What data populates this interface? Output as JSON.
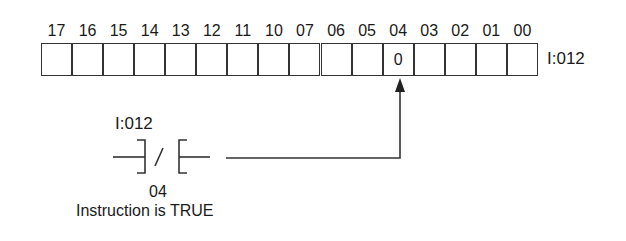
{
  "register": {
    "label": "I:012",
    "bits": [
      "17",
      "16",
      "15",
      "14",
      "13",
      "12",
      "11",
      "10",
      "07",
      "06",
      "05",
      "04",
      "03",
      "02",
      "01",
      "00"
    ],
    "values": [
      "",
      "",
      "",
      "",
      "",
      "",
      "",
      "",
      "",
      "",
      "",
      "0",
      "",
      "",
      "",
      ""
    ],
    "highlighted_bit": "04"
  },
  "instruction": {
    "type": "XIO (examine if open) contact",
    "address": "I:012",
    "bit": "04",
    "status_text": "Instruction is TRUE"
  },
  "colors": {
    "line": "#333333",
    "background": "#ffffff"
  }
}
